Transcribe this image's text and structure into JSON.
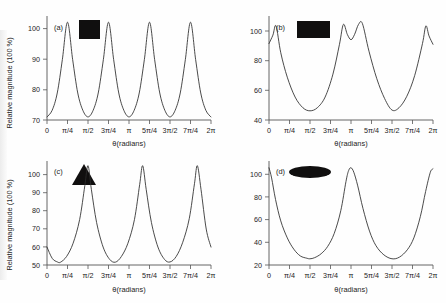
{
  "figure": {
    "background_color": "#fefefe",
    "curve_color": "#2b2b2b",
    "axis_color": "#555555",
    "inset_color": "#100f0f",
    "layout": "2x2 grid of line plots"
  },
  "common": {
    "ylabel": "Relative magnitude (100 %)",
    "xlabel": "θ(radians)",
    "xticklabels": [
      "0",
      "π/4",
      "π/2",
      "3π/4",
      "π",
      "5π/4",
      "3π/2",
      "7π/4",
      "2π"
    ],
    "xtickvalues": [
      0,
      0.7853981634,
      1.5707963268,
      2.3561944902,
      3.1415926536,
      3.926990817,
      4.7123889804,
      5.4977871438,
      6.2831853072
    ]
  },
  "chart_data": [
    {
      "type": "line",
      "panel": "(a)",
      "title": "",
      "inset_shape": "square",
      "xlabel": "θ(radians)",
      "ylabel": "Relative magnitude (100 %)",
      "xlim": [
        0,
        6.2831853072
      ],
      "ylim": [
        69.5,
        103
      ],
      "yticklabels": [
        "70",
        "80",
        "90",
        "100"
      ],
      "ytickvalues": [
        70,
        80,
        90,
        100
      ],
      "grid": false,
      "legend": "none",
      "symmetry_fold": 4,
      "peak_value": 101,
      "trough_value": 70.5,
      "peak_positions": [
        "π/4",
        "3π/4",
        "5π/4",
        "7π/4"
      ],
      "trough_positions": [
        "0",
        "π/2",
        "π",
        "3π/2",
        "2π"
      ],
      "x": [
        0,
        0.196,
        0.393,
        0.589,
        0.785,
        0.982,
        1.178,
        1.374,
        1.571,
        1.767,
        1.963,
        2.16,
        2.356,
        2.553,
        2.749,
        2.945,
        3.142,
        3.338,
        3.534,
        3.731,
        3.927,
        4.123,
        4.32,
        4.516,
        4.712,
        4.909,
        5.105,
        5.301,
        5.498,
        5.694,
        5.89,
        6.087,
        6.283
      ],
      "values": [
        70.5,
        72.6,
        78.2,
        89.0,
        101.0,
        89.0,
        78.2,
        72.6,
        70.5,
        72.6,
        78.2,
        89.0,
        101.0,
        89.0,
        78.2,
        72.6,
        70.5,
        72.6,
        78.2,
        89.0,
        101.0,
        89.0,
        78.2,
        72.6,
        70.5,
        72.6,
        78.2,
        89.0,
        101.0,
        89.0,
        78.2,
        72.6,
        70.5
      ]
    },
    {
      "type": "line",
      "panel": "(b)",
      "title": "",
      "inset_shape": "rectangle",
      "xlabel": "θ(radians)",
      "ylabel": "",
      "xlim": [
        0,
        6.2831853072
      ],
      "ylim": [
        38,
        106
      ],
      "yticklabels": [
        "40",
        "60",
        "80",
        "100"
      ],
      "ytickvalues": [
        40,
        60,
        80,
        100
      ],
      "grid": false,
      "legend": "none",
      "symmetry_fold": 2,
      "peak_value": 101,
      "trough_value": 44,
      "peak_positions": [
        "0.27",
        "2.70",
        "3.58",
        "6.01"
      ],
      "trough_positions": [
        "π/2",
        "3π/2"
      ],
      "x": [
        0,
        0.15,
        0.27,
        0.45,
        0.7,
        1.0,
        1.3,
        1.571,
        1.85,
        2.15,
        2.45,
        2.7,
        2.85,
        3.0,
        3.142,
        3.28,
        3.43,
        3.58,
        3.83,
        4.13,
        4.43,
        4.712,
        4.98,
        5.28,
        5.58,
        5.88,
        6.01,
        6.13,
        6.283
      ],
      "values": [
        88.0,
        93.5,
        99.5,
        82.0,
        66.0,
        53.0,
        46.0,
        44.0,
        46.0,
        53.0,
        68.0,
        87.5,
        100.5,
        94.0,
        90.5,
        94.0,
        100.5,
        101.0,
        83.0,
        65.0,
        52.0,
        44.5,
        46.0,
        53.5,
        67.0,
        88.0,
        99.5,
        93.0,
        87.5
      ]
    },
    {
      "type": "line",
      "panel": "(c)",
      "title": "",
      "inset_shape": "triangle",
      "xlabel": "θ(radians)",
      "ylabel": "Relative magnitude (100 %)",
      "xlim": [
        0,
        6.2831853072
      ],
      "ylim": [
        49,
        104
      ],
      "yticklabels": [
        "50",
        "60",
        "70",
        "80",
        "90",
        "100"
      ],
      "ytickvalues": [
        50,
        60,
        70,
        80,
        90,
        100
      ],
      "grid": false,
      "legend": "none",
      "symmetry_fold": 3,
      "peak_value": 101.5,
      "trough_value": 50.5,
      "peak_positions": [
        "π/2",
        "7π/6",
        "11π/6"
      ],
      "trough_positions": [
        "0.52",
        "2.62",
        "4.71"
      ],
      "x": [
        0,
        0.2,
        0.4,
        0.52,
        0.75,
        1.0,
        1.25,
        1.45,
        1.571,
        1.7,
        1.9,
        2.15,
        2.4,
        2.62,
        2.85,
        3.1,
        3.35,
        3.55,
        3.665,
        3.8,
        4.0,
        4.25,
        4.5,
        4.712,
        4.95,
        5.2,
        5.45,
        5.65,
        5.76,
        5.9,
        6.1,
        6.283
      ],
      "values": [
        58.5,
        52.5,
        50.6,
        50.5,
        53.5,
        60.5,
        73.0,
        91.0,
        101.5,
        89.0,
        71.5,
        58.5,
        52.0,
        50.5,
        53.5,
        60.5,
        73.0,
        91.5,
        101.5,
        89.0,
        71.5,
        58.5,
        52.0,
        50.6,
        53.5,
        61.0,
        73.5,
        92.0,
        101.5,
        89.0,
        68.0,
        58.5
      ]
    },
    {
      "type": "line",
      "panel": "(d)",
      "title": "",
      "inset_shape": "ellipse",
      "xlabel": "θ(radians)",
      "ylabel": "",
      "xlim": [
        0,
        6.2831853072
      ],
      "ylim": [
        18,
        110
      ],
      "yticklabels": [
        "20",
        "40",
        "60",
        "80",
        "100"
      ],
      "ytickvalues": [
        20,
        40,
        60,
        80,
        100
      ],
      "grid": false,
      "legend": "none",
      "symmetry_fold": 2,
      "peak_value": 104,
      "trough_value": 23.5,
      "peak_positions": [
        "0",
        "π",
        "2π"
      ],
      "trough_positions": [
        "π/2",
        "3π/2"
      ],
      "x": [
        0,
        0.1,
        0.25,
        0.45,
        0.7,
        0.95,
        1.2,
        1.45,
        1.571,
        1.75,
        2.0,
        2.25,
        2.5,
        2.75,
        2.95,
        3.05,
        3.142,
        3.25,
        3.4,
        3.6,
        3.85,
        4.1,
        4.4,
        4.712,
        5.0,
        5.3,
        5.55,
        5.8,
        6.0,
        6.18,
        6.283
      ],
      "values": [
        104.0,
        95.0,
        76.0,
        57.0,
        42.0,
        32.0,
        26.0,
        24.0,
        23.5,
        24.5,
        28.0,
        34.5,
        46.0,
        66.0,
        92.0,
        101.5,
        104.0,
        100.0,
        88.0,
        68.0,
        48.0,
        35.0,
        27.0,
        23.5,
        25.0,
        31.5,
        42.0,
        61.0,
        83.0,
        100.0,
        103.0
      ]
    }
  ]
}
